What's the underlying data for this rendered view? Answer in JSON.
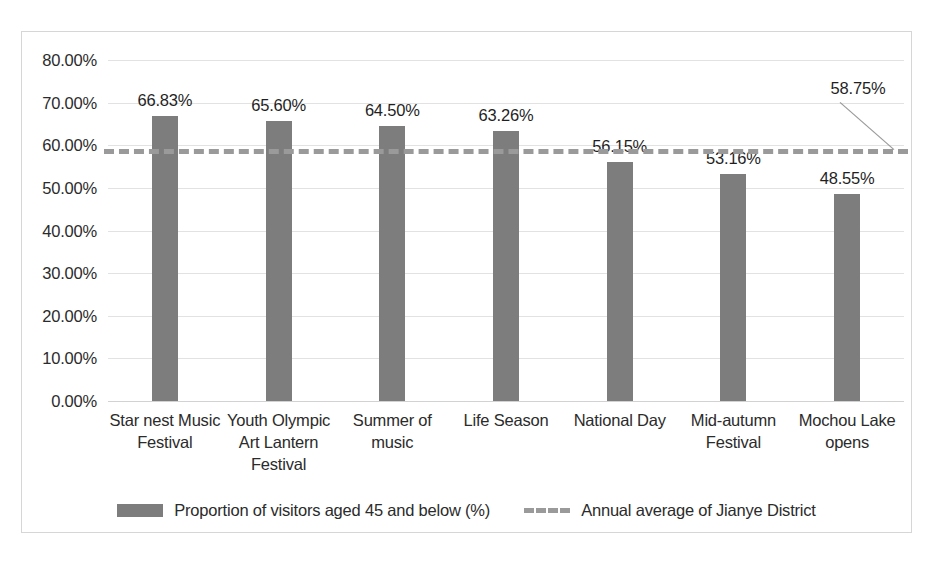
{
  "chart_data": {
    "type": "bar",
    "title": "",
    "xlabel": "",
    "ylabel": "",
    "ylim": [
      0,
      80
    ],
    "ytick_step": 10,
    "ytick_labels": [
      "0.00%",
      "10.00%",
      "20.00%",
      "30.00%",
      "40.00%",
      "50.00%",
      "60.00%",
      "70.00%",
      "80.00%"
    ],
    "grid": true,
    "legend_position": "bottom",
    "categories": [
      "Star nest Music Festival",
      "Youth Olympic Art Lantern Festival",
      "Summer of music",
      "Life Season",
      "National Day",
      "Mid-autumn Festival",
      "Mochou Lake opens"
    ],
    "series": [
      {
        "name": "Proportion of visitors aged 45 and below (%)",
        "type": "bar",
        "color": "#7d7d7d",
        "values": [
          66.83,
          65.6,
          64.5,
          63.26,
          56.15,
          53.16,
          48.55
        ],
        "data_labels": [
          "66.83%",
          "65.60%",
          "64.50%",
          "63.26%",
          "56.15%",
          "53.16%",
          "48.55%"
        ]
      },
      {
        "name": "Annual average of Jianye District",
        "type": "line",
        "style": "dashed",
        "color": "#9a9a9a",
        "value": 58.75,
        "data_label": "58.75%"
      }
    ],
    "annotations": [
      {
        "text": "58.75%",
        "target": "annual-average-line-end",
        "has_leader_line": true
      }
    ]
  },
  "legend": {
    "items": [
      {
        "label": "Proportion of visitors aged 45 and below (%)",
        "marker": "solid-bar-swatch"
      },
      {
        "label": "Annual average of Jianye District",
        "marker": "dashed-line-swatch"
      }
    ]
  },
  "caption": {
    "text": ""
  }
}
